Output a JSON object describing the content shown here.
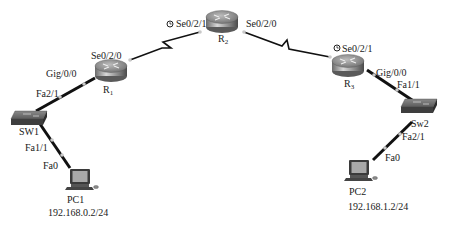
{
  "diagram": {
    "type": "network-topology",
    "devices": {
      "r1": {
        "name": "R",
        "sub": "1",
        "kind": "router"
      },
      "r2": {
        "name": "R",
        "sub": "2",
        "kind": "router"
      },
      "r3": {
        "name": "R",
        "sub": "3",
        "kind": "router"
      },
      "sw1": {
        "name": "SW1",
        "kind": "switch"
      },
      "sw2": {
        "name": "Sw2",
        "kind": "switch"
      },
      "pc1": {
        "name": "PC1",
        "ip": "192.168.0.2/24",
        "kind": "pc"
      },
      "pc2": {
        "name": "PC2",
        "ip": "192.168.1.2/24",
        "kind": "pc"
      }
    },
    "interfaces": {
      "r1_se": "Se0/2/0",
      "r1_gig": "Gig/0/0",
      "sw1_fa21": "Fa2/1",
      "sw1_fa11": "Fa1/1",
      "pc1_fa0": "Fa0",
      "r2_se021": "Se0/2/1",
      "r2_se020": "Se0/2/0",
      "r3_se021": "Se0/2/1",
      "r3_gig": "Gig/0/0",
      "sw2_fa11": "Fa1/1",
      "sw2_fa21": "Fa2/1",
      "pc2_fa0": "Fa0"
    },
    "links": [
      {
        "from": "sw1",
        "to": "r1",
        "type": "ethernet",
        "ports": [
          "Fa2/1",
          "Gig/0/0"
        ]
      },
      {
        "from": "r1",
        "to": "r2",
        "type": "serial",
        "ports": [
          "Se0/2/0",
          "Se0/2/1"
        ],
        "dce": "r2"
      },
      {
        "from": "r2",
        "to": "r3",
        "type": "serial",
        "ports": [
          "Se0/2/0",
          "Se0/2/1"
        ],
        "dce": "r3"
      },
      {
        "from": "r3",
        "to": "sw2",
        "type": "ethernet",
        "ports": [
          "Gig/0/0",
          "Fa1/1"
        ]
      },
      {
        "from": "sw1",
        "to": "pc1",
        "type": "ethernet",
        "ports": [
          "Fa1/1",
          "Fa0"
        ]
      },
      {
        "from": "sw2",
        "to": "pc2",
        "type": "ethernet",
        "ports": [
          "Fa2/1",
          "Fa0"
        ]
      }
    ],
    "clock_icon": "clock-icon"
  }
}
